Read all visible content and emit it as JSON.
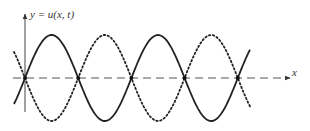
{
  "figure": {
    "y_axis_label": "y = u(x, t)",
    "x_axis_label": "x",
    "colors": {
      "curve": "#222222",
      "axis": "#444444",
      "dashed_axis": "#555555"
    }
  },
  "chart_data": {
    "type": "line",
    "title": "",
    "xlabel": "x",
    "ylabel": "y = u(x, t)",
    "grid": false,
    "legend": null,
    "series": [
      {
        "name": "solid wave",
        "style": "solid",
        "function": "A·sin(kx)",
        "x_range_half_periods": [
          -0.2,
          4.4
        ]
      },
      {
        "name": "dotted wave",
        "style": "dotted",
        "function": "-A·sin(kx)",
        "x_range_half_periods": [
          -0.2,
          4.4
        ]
      }
    ],
    "annotations": [
      "nodes (dots) at intersections on x-axis: x = 0, 1, 2, 3, 4 half-periods",
      "dashed horizontal x-axis"
    ]
  }
}
